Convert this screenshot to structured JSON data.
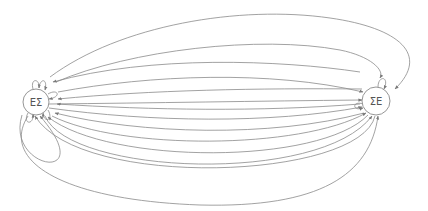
{
  "diagram": {
    "type": "state-transition-graph",
    "nodes": [
      {
        "id": "left",
        "label": "ΕΣ",
        "cx": 36,
        "cy": 102,
        "r": 13
      },
      {
        "id": "right",
        "label": "ΣΕ",
        "cx": 376,
        "cy": 101,
        "r": 14
      }
    ],
    "edge_color": "#8a8a8a",
    "edges_summary": {
      "left_to_right": 6,
      "right_to_left": 6,
      "left_self_loops": 4,
      "right_self_loops": 2
    }
  }
}
